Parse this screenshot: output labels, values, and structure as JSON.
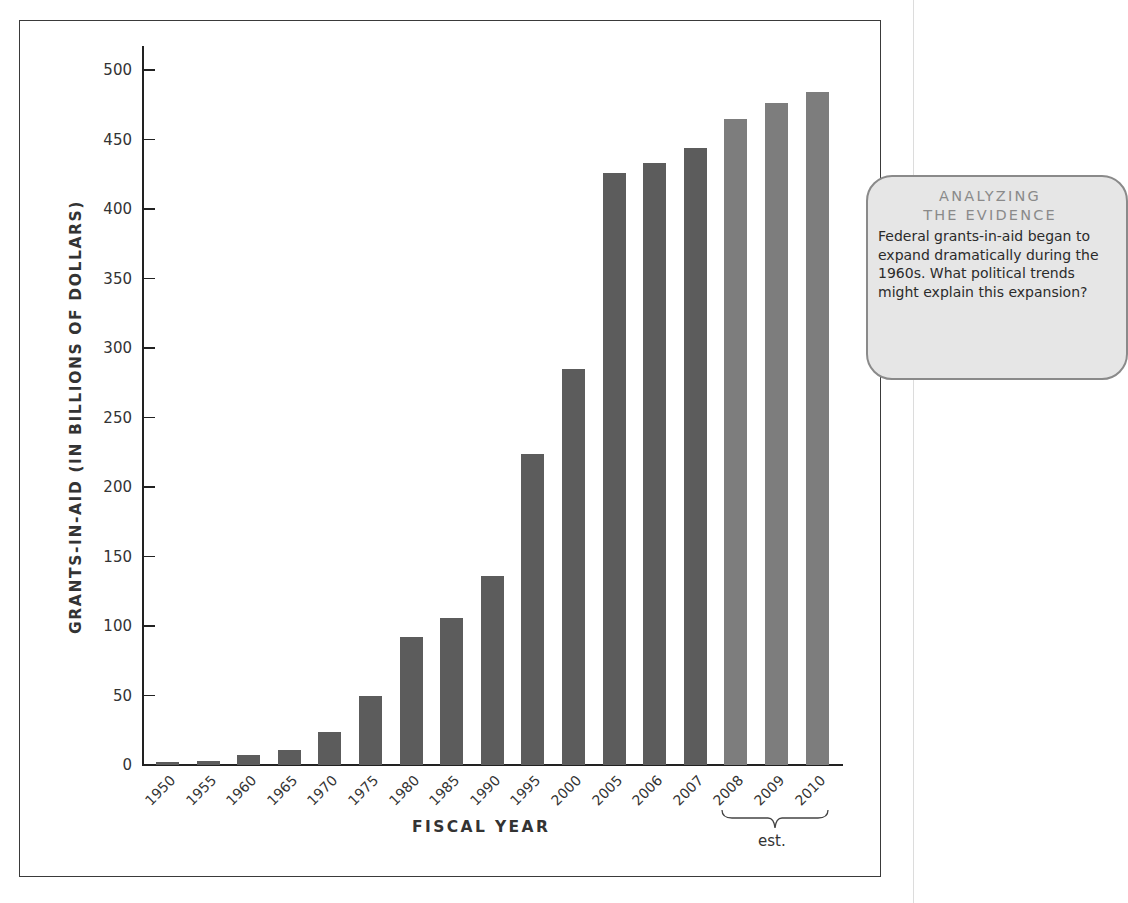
{
  "chart_data": {
    "type": "bar",
    "title": "",
    "xlabel": "FISCAL YEAR",
    "ylabel": "GRANTS-IN-AID (IN BILLIONS OF DOLLARS)",
    "ylim": [
      0,
      500
    ],
    "yticks": [
      0,
      50,
      100,
      150,
      200,
      250,
      300,
      350,
      400,
      450,
      500
    ],
    "grid": false,
    "legend": null,
    "categories": [
      "1950",
      "1955",
      "1960",
      "1965",
      "1970",
      "1975",
      "1980",
      "1985",
      "1990",
      "1995",
      "2000",
      "2005",
      "2006",
      "2007",
      "2008",
      "2009",
      "2010"
    ],
    "values": [
      2,
      3,
      7,
      11,
      24,
      50,
      92,
      106,
      136,
      224,
      285,
      426,
      433,
      444,
      465,
      476,
      484
    ],
    "estimated": [
      false,
      false,
      false,
      false,
      false,
      false,
      false,
      false,
      false,
      false,
      false,
      false,
      false,
      false,
      true,
      true,
      true
    ],
    "annotations": [
      {
        "text": "est.",
        "applies_to": [
          "2008",
          "2009",
          "2010"
        ]
      }
    ],
    "colors": {
      "actual": "#5c5c5c",
      "estimate": "#7d7d7d"
    }
  },
  "callout": {
    "heading_line1": "ANALYZING",
    "heading_line2": "THE EVIDENCE",
    "body": "Federal grants-in-aid began to expand dramatically during the 1960s. What political trends might explain this expansion?"
  }
}
